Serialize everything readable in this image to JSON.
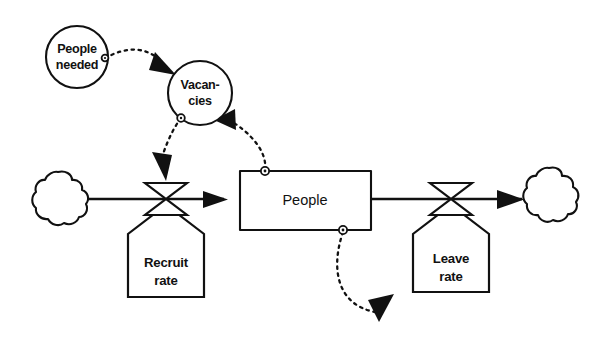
{
  "diagram": {
    "type": "system-dynamics-stock-and-flow",
    "title": "",
    "background_color": "#ffffff",
    "line_color": "#111111",
    "nodes": {
      "people_needed": {
        "kind": "auxiliary-circle",
        "label_line1": "People",
        "label_line2": "needed",
        "cx": 77,
        "cy": 57,
        "r": 31
      },
      "vacancies": {
        "kind": "auxiliary-circle",
        "label_line1": "Vacan-",
        "label_line2": "cies",
        "cx": 200,
        "cy": 93,
        "r": 32
      },
      "people_stock": {
        "kind": "stock-box",
        "label": "People",
        "x": 240,
        "y": 171,
        "width": 131,
        "height": 59
      },
      "recruit_rate": {
        "kind": "flow-rate-valve",
        "label_line1": "Recruit",
        "label_line2": "rate",
        "cx": 166,
        "cy": 200
      },
      "leave_rate": {
        "kind": "flow-rate-valve",
        "label_line1": "Leave",
        "label_line2": "rate",
        "cx": 451,
        "cy": 200
      },
      "source_cloud": {
        "kind": "cloud-source",
        "label": "",
        "cx": 58,
        "cy": 199
      },
      "sink_cloud": {
        "kind": "cloud-sink",
        "label": "",
        "cx": 549,
        "cy": 198
      }
    },
    "flows": [
      {
        "name": "recruit-flow",
        "from": "source_cloud",
        "to": "people_stock",
        "via": "recruit_rate",
        "style": "solid-double-line-arrow"
      },
      {
        "name": "leave-flow",
        "from": "people_stock",
        "to": "sink_cloud",
        "via": "leave_rate",
        "style": "solid-double-line-arrow"
      }
    ],
    "info_links": [
      {
        "name": "people-needed-to-vacancies",
        "from": "people_needed",
        "to": "vacancies",
        "style": "dashed-curve-arrow"
      },
      {
        "name": "people-to-vacancies",
        "from": "people_stock",
        "to": "vacancies",
        "style": "dashed-curve-arrow"
      },
      {
        "name": "vacancies-to-recruit-rate",
        "from": "vacancies",
        "to": "recruit_rate",
        "style": "dashed-curve-arrow"
      },
      {
        "name": "people-to-leave-rate",
        "from": "people_stock",
        "to": "leave_rate",
        "style": "dashed-curve-arrow"
      }
    ]
  }
}
